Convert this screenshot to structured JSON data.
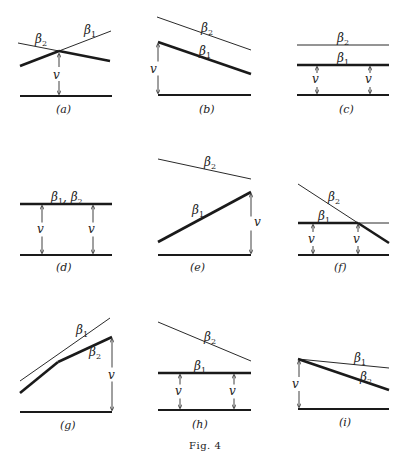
{
  "figure": {
    "caption": "Fig. 4",
    "panels": [
      {
        "id": "a",
        "label": "(a)",
        "base": [
          20,
          96,
          112,
          96
        ],
        "thick": [
          [
            20,
            66,
            59,
            51
          ],
          [
            59,
            51,
            110,
            61
          ]
        ],
        "thin": [
          [
            18,
            43,
            59,
            51
          ],
          [
            59,
            51,
            111,
            31
          ]
        ],
        "arrows": [
          {
            "x": 59,
            "y1": 54,
            "y2": 94
          }
        ],
        "labels": [
          {
            "text": "β",
            "sub": "2",
            "x": 35,
            "y": 43
          },
          {
            "text": "β",
            "sub": "1",
            "x": 84,
            "y": 34
          },
          {
            "text": "v",
            "x": 53,
            "y": 79
          },
          {
            "text": "(a)",
            "x": 56,
            "y": 113,
            "kind": "caption"
          }
        ]
      },
      {
        "id": "b",
        "label": "(b)",
        "base": [
          158,
          95,
          251,
          95
        ],
        "thick": [
          [
            158,
            42,
            251,
            74
          ]
        ],
        "thin": [
          [
            157,
            17,
            251,
            50
          ]
        ],
        "arrows": [
          {
            "x": 158,
            "y1": 44,
            "y2": 93
          }
        ],
        "labels": [
          {
            "text": "β",
            "sub": "2",
            "x": 201,
            "y": 32
          },
          {
            "text": "β",
            "sub": "1",
            "x": 199,
            "y": 55
          },
          {
            "text": "v",
            "x": 150,
            "y": 73
          },
          {
            "text": "(b)",
            "x": 199,
            "y": 113,
            "kind": "caption"
          }
        ]
      },
      {
        "id": "c",
        "label": "(c)",
        "base": [
          297,
          95,
          389,
          95
        ],
        "thick": [
          [
            297,
            65,
            389,
            65
          ]
        ],
        "thin": [
          [
            297,
            45,
            389,
            45
          ]
        ],
        "arrows": [
          {
            "x": 317,
            "y1": 67,
            "y2": 93
          },
          {
            "x": 370,
            "y1": 67,
            "y2": 93
          }
        ],
        "labels": [
          {
            "text": "β",
            "sub": "2",
            "x": 337,
            "y": 42
          },
          {
            "text": "β",
            "sub": "1",
            "x": 337,
            "y": 62
          },
          {
            "text": "v",
            "x": 312,
            "y": 83
          },
          {
            "text": "v",
            "x": 365,
            "y": 83
          },
          {
            "text": "(c)",
            "x": 339,
            "y": 113,
            "kind": "caption"
          }
        ]
      },
      {
        "id": "d",
        "label": "(d)",
        "base": [
          20,
          255,
          112,
          255
        ],
        "thick": [
          [
            20,
            204,
            112,
            204
          ]
        ],
        "thin": [],
        "arrows": [
          {
            "x": 42,
            "y1": 206,
            "y2": 253
          },
          {
            "x": 93,
            "y1": 206,
            "y2": 253
          }
        ],
        "labels": [
          {
            "text": "β",
            "sub": "1",
            "x": 51,
            "y": 201,
            "suffix": ", β",
            "sub2": "2"
          },
          {
            "text": "v",
            "x": 37,
            "y": 233
          },
          {
            "text": "v",
            "x": 88,
            "y": 233
          },
          {
            "text": "(d)",
            "x": 56,
            "y": 271,
            "kind": "caption"
          }
        ]
      },
      {
        "id": "e",
        "label": "(e)",
        "base": [
          158,
          255,
          251,
          255
        ],
        "thick": [
          [
            158,
            242,
            251,
            192
          ]
        ],
        "thin": [
          [
            158,
            159,
            251,
            179
          ]
        ],
        "arrows": [
          {
            "x": 251,
            "y1": 194,
            "y2": 253
          }
        ],
        "labels": [
          {
            "text": "β",
            "sub": "2",
            "x": 204,
            "y": 166
          },
          {
            "text": "β",
            "sub": "1",
            "x": 192,
            "y": 214
          },
          {
            "text": "v",
            "x": 254,
            "y": 226
          },
          {
            "text": "(e)",
            "x": 190,
            "y": 271,
            "kind": "caption"
          }
        ]
      },
      {
        "id": "f",
        "label": "(f)",
        "base": [
          298,
          255,
          389,
          255
        ],
        "thick": [
          [
            298,
            223,
            358,
            223
          ],
          [
            358,
            223,
            389,
            243
          ]
        ],
        "thin": [
          [
            358,
            223,
            389,
            223
          ],
          [
            298,
            184,
            358,
            223
          ]
        ],
        "arrows": [
          {
            "x": 313,
            "y1": 225,
            "y2": 253
          },
          {
            "x": 358,
            "y1": 225,
            "y2": 253
          }
        ],
        "labels": [
          {
            "text": "β",
            "sub": "2",
            "x": 328,
            "y": 201
          },
          {
            "text": "β",
            "sub": "1",
            "x": 318,
            "y": 220
          },
          {
            "text": "v",
            "x": 308,
            "y": 243
          },
          {
            "text": "v",
            "x": 353,
            "y": 243
          },
          {
            "text": "(f)",
            "x": 334,
            "y": 271,
            "kind": "caption"
          }
        ]
      },
      {
        "id": "g",
        "label": "(g)",
        "base": [
          20,
          412,
          112,
          412
        ],
        "thick": [
          [
            20,
            393,
            58,
            362
          ],
          [
            58,
            362,
            112,
            337
          ]
        ],
        "thin": [
          [
            20,
            381,
            110,
            318
          ]
        ],
        "arrows": [
          {
            "x": 112,
            "y1": 339,
            "y2": 410
          }
        ],
        "labels": [
          {
            "text": "β",
            "sub": "1",
            "x": 76,
            "y": 334
          },
          {
            "text": "β",
            "sub": "2",
            "x": 89,
            "y": 356
          },
          {
            "text": "v",
            "x": 108,
            "y": 379
          },
          {
            "text": "(g)",
            "x": 60,
            "y": 429,
            "kind": "caption"
          }
        ]
      },
      {
        "id": "h",
        "label": "(h)",
        "base": [
          158,
          410,
          251,
          410
        ],
        "thick": [
          [
            158,
            373,
            251,
            373
          ]
        ],
        "thin": [
          [
            158,
            322,
            251,
            361
          ]
        ],
        "arrows": [
          {
            "x": 180,
            "y1": 375,
            "y2": 408
          },
          {
            "x": 234,
            "y1": 375,
            "y2": 408
          }
        ],
        "labels": [
          {
            "text": "β",
            "sub": "2",
            "x": 204,
            "y": 341
          },
          {
            "text": "β",
            "sub": "1",
            "x": 194,
            "y": 370
          },
          {
            "text": "v",
            "x": 175,
            "y": 395
          },
          {
            "text": "v",
            "x": 229,
            "y": 395
          },
          {
            "text": "(h)",
            "x": 192,
            "y": 428,
            "kind": "caption"
          }
        ]
      },
      {
        "id": "i",
        "label": "(i)",
        "base": [
          298,
          409,
          389,
          409
        ],
        "thick": [
          [
            298,
            359,
            389,
            390
          ]
        ],
        "thin": [
          [
            298,
            359,
            389,
            368
          ]
        ],
        "arrows": [
          {
            "x": 299,
            "y1": 361,
            "y2": 407
          }
        ],
        "labels": [
          {
            "text": "β",
            "sub": "1",
            "x": 354,
            "y": 362
          },
          {
            "text": "β",
            "sub": "2",
            "x": 360,
            "y": 381
          },
          {
            "text": "v",
            "x": 292,
            "y": 388
          },
          {
            "text": "(i)",
            "x": 339,
            "y": 426,
            "kind": "caption"
          }
        ]
      }
    ]
  }
}
